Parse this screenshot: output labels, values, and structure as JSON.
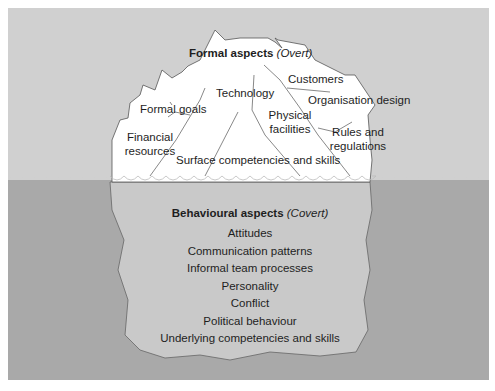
{
  "diagram": {
    "type": "iceberg",
    "colors": {
      "sky": "#d0d0d0",
      "water": "#a8a8a8",
      "iceberg_above": "#ffffff",
      "iceberg_below": "#c9c9c9",
      "outline": "#555555",
      "text": "#1e1e1e"
    },
    "above_water": {
      "title_bold": "Formal aspects",
      "title_italic": "(Overt)",
      "items": [
        {
          "label": "Customers"
        },
        {
          "label": "Technology"
        },
        {
          "label": "Organisation design"
        },
        {
          "label": "Formal goals"
        },
        {
          "label": "Physical"
        },
        {
          "label": "facilities"
        },
        {
          "label": "Financial"
        },
        {
          "label": "resources"
        },
        {
          "label": "Rules and"
        },
        {
          "label": "regulations"
        },
        {
          "label": "Surface competencies and skills"
        }
      ]
    },
    "below_water": {
      "title_bold": "Behavioural aspects",
      "title_italic": "(Covert)",
      "items": [
        {
          "label": "Attitudes"
        },
        {
          "label": "Communication patterns"
        },
        {
          "label": "Informal team processes"
        },
        {
          "label": "Personality"
        },
        {
          "label": "Conflict"
        },
        {
          "label": "Political behaviour"
        },
        {
          "label": "Underlying competencies and skills"
        }
      ]
    }
  }
}
